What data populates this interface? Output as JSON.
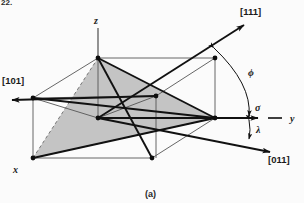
{
  "figure": {
    "caption": "(a)",
    "cropped_figure_number": "22.",
    "background_color": "#fbfbfb",
    "line_color": "#111111",
    "shade_color": "#c2c2c2",
    "dashed_color": "#6a6a6a"
  },
  "axes": [
    {
      "id": "z",
      "label": "z",
      "kind": "axis"
    },
    {
      "id": "y",
      "label": "y",
      "kind": "axis"
    },
    {
      "id": "x",
      "label": "x",
      "kind": "axis"
    }
  ],
  "directions": [
    {
      "id": "d111",
      "label": "[111]",
      "kind": "crystal-direction"
    },
    {
      "id": "d101",
      "label": "[101]",
      "kind": "crystal-direction"
    },
    {
      "id": "d011",
      "label": "[011]",
      "kind": "crystal-direction"
    }
  ],
  "angles": [
    {
      "id": "phi",
      "label": "ϕ",
      "name": "phi-angle-label"
    },
    {
      "id": "sigma",
      "label": "σ",
      "name": "sigma-stress-label"
    },
    {
      "id": "lambda",
      "label": "λ",
      "name": "lambda-angle-label"
    }
  ],
  "geometry": {
    "description": "Cubic unit cell drawn in oblique projection with a shaded (111)-type slip plane triangle",
    "vertices": {
      "top_back": [
        98,
        58
      ],
      "left_back": [
        33,
        98
      ],
      "center_mid": [
        156,
        96
      ],
      "origin_x": [
        33,
        158
      ],
      "node_junction": [
        215,
        118
      ],
      "top_right_back": [
        215,
        58
      ],
      "bottom_right_front": [
        152,
        158
      ],
      "front_inner": [
        98,
        118
      ]
    },
    "shaded_triangle": [
      [
        98,
        58
      ],
      [
        33,
        158
      ],
      [
        215,
        118
      ]
    ]
  },
  "colors": {
    "ink": "#111111",
    "thin_line": "#555555",
    "gray_fill": "#c2c2c2",
    "paper": "#fbfbfb"
  }
}
